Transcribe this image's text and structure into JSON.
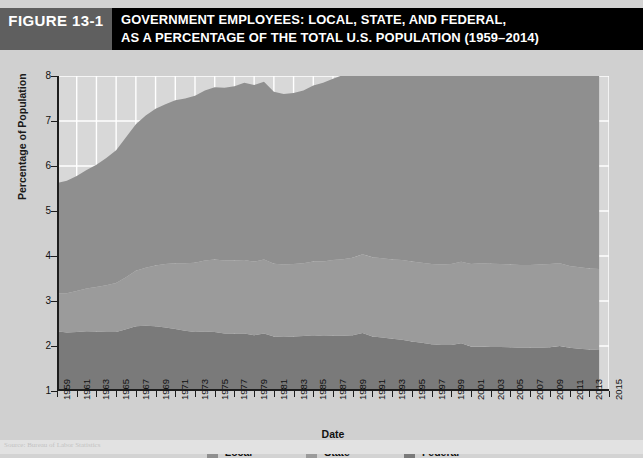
{
  "figure": {
    "tag": "FIGURE 13-1",
    "title_line_1": "GOVERNMENT EMPLOYEES: LOCAL, STATE, AND FEDERAL,",
    "title_line_2": "AS A PERCENTAGE OF THE TOTAL U.S. POPULATION (1959–2014)",
    "tag_bg": "#5f5f5f",
    "title_bg": "#000000",
    "page_bg": "#d3d3d3"
  },
  "source": {
    "text": "Source: Bureau of Labor Statistics"
  },
  "legend": {
    "items": [
      {
        "label": "Local",
        "color": "#8f8f8f"
      },
      {
        "label": "State",
        "color": "#9b9b9b"
      },
      {
        "label": "Federal",
        "color": "#7a7a7a"
      }
    ]
  },
  "chart_data": {
    "type": "area",
    "stacked": true,
    "title": "GOVERNMENT EMPLOYEES: LOCAL, STATE, AND FEDERAL, AS A PERCENTAGE OF THE TOTAL U.S. POPULATION (1959–2014)",
    "xlabel": "Date",
    "ylabel": "Percentage of Population",
    "xlim": [
      1959,
      2015
    ],
    "ylim": [
      1,
      8
    ],
    "yticks": [
      1,
      2,
      3,
      4,
      5,
      6,
      7,
      8
    ],
    "xticks": [
      1959,
      1961,
      1963,
      1965,
      1967,
      1969,
      1971,
      1973,
      1975,
      1977,
      1979,
      1981,
      1983,
      1985,
      1987,
      1989,
      1991,
      1993,
      1995,
      1997,
      1999,
      2001,
      2003,
      2005,
      2007,
      2009,
      2011,
      2013,
      2015
    ],
    "grid": true,
    "grid_color": "#ffffff",
    "plot_bg": "#d8d8d8",
    "legend_position": "bottom",
    "x": [
      1959,
      1960,
      1961,
      1962,
      1963,
      1964,
      1965,
      1966,
      1967,
      1968,
      1969,
      1970,
      1971,
      1972,
      1973,
      1974,
      1975,
      1976,
      1977,
      1978,
      1979,
      1980,
      1981,
      1982,
      1983,
      1984,
      1985,
      1986,
      1987,
      1988,
      1989,
      1990,
      1991,
      1992,
      1993,
      1994,
      1995,
      1996,
      1997,
      1998,
      1999,
      2000,
      2001,
      2002,
      2003,
      2004,
      2005,
      2006,
      2007,
      2008,
      2009,
      2010,
      2011,
      2012,
      2013,
      2014
    ],
    "series": [
      {
        "name": "Federal",
        "color": "#7a7a7a",
        "values": [
          1.33,
          1.3,
          1.31,
          1.33,
          1.32,
          1.31,
          1.31,
          1.37,
          1.44,
          1.45,
          1.44,
          1.41,
          1.38,
          1.34,
          1.31,
          1.32,
          1.31,
          1.28,
          1.28,
          1.28,
          1.24,
          1.28,
          1.21,
          1.2,
          1.21,
          1.22,
          1.24,
          1.22,
          1.23,
          1.23,
          1.24,
          1.29,
          1.21,
          1.19,
          1.16,
          1.14,
          1.1,
          1.07,
          1.04,
          1.02,
          1.02,
          1.06,
          0.99,
          0.99,
          0.98,
          0.98,
          0.97,
          0.96,
          0.96,
          0.96,
          0.97,
          1.0,
          0.96,
          0.94,
          0.92,
          0.91
        ]
      },
      {
        "name": "State",
        "color": "#9b9b9b",
        "values": [
          0.84,
          0.87,
          0.91,
          0.95,
          0.99,
          1.04,
          1.09,
          1.16,
          1.23,
          1.29,
          1.35,
          1.41,
          1.46,
          1.5,
          1.54,
          1.58,
          1.61,
          1.62,
          1.62,
          1.63,
          1.63,
          1.64,
          1.62,
          1.61,
          1.61,
          1.62,
          1.64,
          1.66,
          1.68,
          1.7,
          1.72,
          1.75,
          1.76,
          1.76,
          1.76,
          1.77,
          1.78,
          1.78,
          1.78,
          1.79,
          1.8,
          1.81,
          1.83,
          1.85,
          1.85,
          1.84,
          1.84,
          1.84,
          1.84,
          1.85,
          1.85,
          1.84,
          1.82,
          1.81,
          1.8,
          1.8
        ]
      },
      {
        "name": "Local",
        "color": "#8f8f8f",
        "values": [
          2.45,
          2.5,
          2.56,
          2.63,
          2.72,
          2.83,
          2.95,
          3.11,
          3.26,
          3.38,
          3.48,
          3.55,
          3.62,
          3.66,
          3.71,
          3.78,
          3.83,
          3.84,
          3.87,
          3.94,
          3.93,
          3.95,
          3.82,
          3.79,
          3.8,
          3.84,
          3.91,
          3.97,
          4.03,
          4.09,
          4.15,
          4.22,
          4.2,
          4.2,
          4.22,
          4.26,
          4.3,
          4.32,
          4.35,
          4.38,
          4.42,
          4.47,
          4.53,
          4.58,
          4.58,
          4.58,
          4.59,
          4.61,
          4.63,
          4.64,
          4.62,
          4.55,
          4.46,
          4.42,
          4.41,
          4.43
        ]
      }
    ],
    "total_peak": {
      "year": 1980,
      "value": 7.25
    },
    "total_end": {
      "year": 2014,
      "value": 7.14
    }
  }
}
